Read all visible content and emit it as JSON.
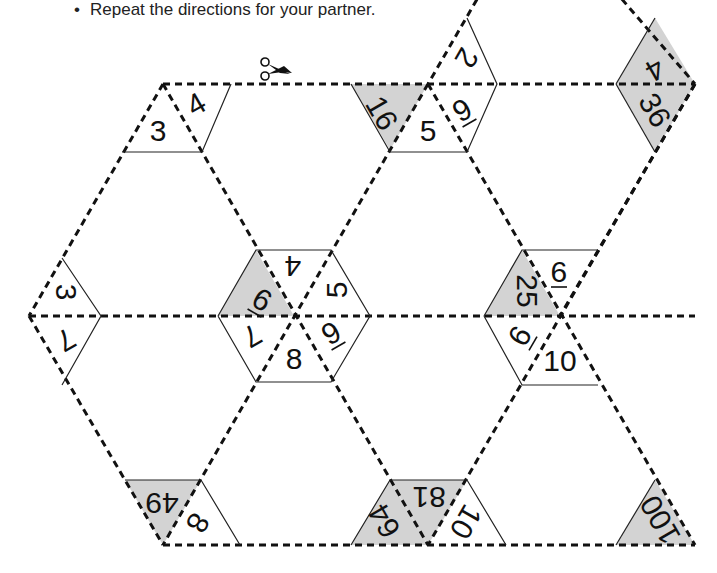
{
  "directions": {
    "items": [
      "Repeat the directions for your partner."
    ]
  },
  "puzzle": {
    "scissors_icon": "scissors-icon",
    "colors": {
      "shade": "#d3d3d3",
      "line": "#111111"
    },
    "labels": [
      {
        "id": "t1",
        "text": "3",
        "x": 158,
        "y": 130,
        "rot": 0
      },
      {
        "id": "t2",
        "text": "4",
        "x": 196,
        "y": 104,
        "rot": -30
      },
      {
        "id": "t3",
        "text": "16",
        "x": 382,
        "y": 113,
        "rot": 60,
        "shaded": true
      },
      {
        "id": "t4",
        "text": "5",
        "x": 428,
        "y": 130,
        "rot": 0
      },
      {
        "id": "t5",
        "text": "9",
        "x": 462,
        "y": 110,
        "rot": -30,
        "mark": "underline"
      },
      {
        "id": "t6",
        "text": "2",
        "x": 467,
        "y": 58,
        "rot": 120
      },
      {
        "id": "t7",
        "text": "4",
        "x": 655,
        "y": 70,
        "rot": 150,
        "shaded": true
      },
      {
        "id": "t8",
        "text": "36",
        "x": 655,
        "y": 110,
        "rot": 60,
        "shaded": true
      },
      {
        "id": "t9",
        "text": "3",
        "x": 66,
        "y": 292,
        "rot": 90
      },
      {
        "id": "t10",
        "text": "7",
        "x": 66,
        "y": 340,
        "rot": 150
      },
      {
        "id": "t11",
        "text": "9",
        "x": 262,
        "y": 300,
        "rot": -150,
        "mark": "overline",
        "shaded": true
      },
      {
        "id": "t12",
        "text": "4",
        "x": 293,
        "y": 266,
        "rot": 180
      },
      {
        "id": "t13",
        "text": "5",
        "x": 336,
        "y": 290,
        "rot": -90
      },
      {
        "id": "t14",
        "text": "9",
        "x": 331,
        "y": 333,
        "rot": -30,
        "mark": "underline"
      },
      {
        "id": "t15",
        "text": "8",
        "x": 294,
        "y": 358,
        "rot": 0
      },
      {
        "id": "t16",
        "text": "7",
        "x": 252,
        "y": 336,
        "rot": 150
      },
      {
        "id": "t17",
        "text": "25",
        "x": 527,
        "y": 291,
        "rot": 90,
        "shaded": true
      },
      {
        "id": "t18",
        "text": "9",
        "x": 559,
        "y": 272,
        "rot": 180,
        "mark": "overline"
      },
      {
        "id": "t19",
        "text": "9",
        "x": 520,
        "y": 336,
        "rot": 120,
        "mark": "overline"
      },
      {
        "id": "t20",
        "text": "10",
        "x": 560,
        "y": 360,
        "rot": 0
      },
      {
        "id": "t21",
        "text": "49",
        "x": 162,
        "y": 503,
        "rot": 180,
        "shaded": true
      },
      {
        "id": "t22",
        "text": "8",
        "x": 198,
        "y": 523,
        "rot": 120
      },
      {
        "id": "t23",
        "text": "64",
        "x": 384,
        "y": 521,
        "rot": -120,
        "shaded": true
      },
      {
        "id": "t24",
        "text": "81",
        "x": 429,
        "y": 497,
        "rot": 180,
        "shaded": true
      },
      {
        "id": "t25",
        "text": "10",
        "x": 466,
        "y": 522,
        "rot": 120
      },
      {
        "id": "t26",
        "text": "100",
        "x": 660,
        "y": 520,
        "rot": -120,
        "shaded": true
      }
    ]
  }
}
